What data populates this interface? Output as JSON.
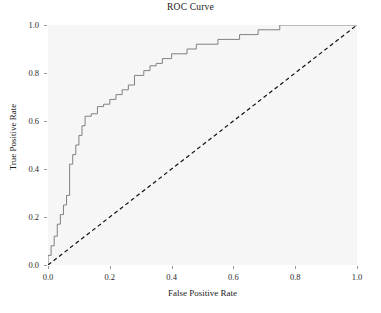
{
  "chart_data": {
    "type": "line",
    "title": "ROC Curve",
    "xlabel": "False Positive Rate",
    "ylabel": "True Positive Rate",
    "xlim": [
      0.0,
      1.0
    ],
    "ylim": [
      0.0,
      1.0
    ],
    "grid": false,
    "legend": "none",
    "panel_background": "#f6f6f6",
    "series": [
      {
        "name": "ROC curve",
        "type": "step",
        "color": "#808080",
        "linestyle": "solid",
        "linewidth": 1.0,
        "x": [
          0.0,
          0.0,
          0.01,
          0.01,
          0.02,
          0.02,
          0.03,
          0.03,
          0.04,
          0.04,
          0.05,
          0.05,
          0.06,
          0.06,
          0.07,
          0.07,
          0.08,
          0.08,
          0.09,
          0.09,
          0.1,
          0.1,
          0.11,
          0.11,
          0.12,
          0.12,
          0.14,
          0.14,
          0.16,
          0.16,
          0.18,
          0.18,
          0.2,
          0.2,
          0.22,
          0.22,
          0.24,
          0.24,
          0.26,
          0.26,
          0.28,
          0.28,
          0.31,
          0.31,
          0.33,
          0.33,
          0.35,
          0.35,
          0.37,
          0.37,
          0.4,
          0.4,
          0.43,
          0.43,
          0.45,
          0.45,
          0.48,
          0.48,
          0.52,
          0.52,
          0.55,
          0.55,
          0.58,
          0.58,
          0.62,
          0.62,
          0.65,
          0.65,
          0.68,
          0.68,
          0.72,
          0.72,
          0.75,
          0.75,
          0.78,
          0.78,
          1.0
        ],
        "y": [
          0.0,
          0.04,
          0.04,
          0.08,
          0.08,
          0.12,
          0.12,
          0.17,
          0.17,
          0.21,
          0.21,
          0.25,
          0.25,
          0.29,
          0.29,
          0.42,
          0.42,
          0.46,
          0.46,
          0.5,
          0.5,
          0.54,
          0.54,
          0.58,
          0.58,
          0.62,
          0.62,
          0.63,
          0.63,
          0.66,
          0.66,
          0.67,
          0.67,
          0.69,
          0.69,
          0.71,
          0.71,
          0.73,
          0.73,
          0.75,
          0.75,
          0.79,
          0.79,
          0.81,
          0.81,
          0.83,
          0.83,
          0.84,
          0.84,
          0.86,
          0.86,
          0.88,
          0.88,
          0.88,
          0.88,
          0.9,
          0.9,
          0.92,
          0.92,
          0.92,
          0.92,
          0.94,
          0.94,
          0.94,
          0.94,
          0.96,
          0.96,
          0.96,
          0.96,
          0.98,
          0.98,
          0.98,
          0.98,
          1.0,
          1.0,
          1.0,
          1.0
        ]
      },
      {
        "name": "Chance reference line",
        "type": "line",
        "color": "#000000",
        "linestyle": "dashed",
        "linewidth": 1.2,
        "x": [
          0.0,
          1.0
        ],
        "y": [
          0.0,
          1.0
        ]
      }
    ],
    "x_ticks": [
      {
        "value": 0.0,
        "label": "0.0"
      },
      {
        "value": 0.2,
        "label": "0.2"
      },
      {
        "value": 0.4,
        "label": "0.4"
      },
      {
        "value": 0.6,
        "label": "0.6"
      },
      {
        "value": 0.8,
        "label": "0.8"
      },
      {
        "value": 1.0,
        "label": "1.0"
      }
    ],
    "y_ticks": [
      {
        "value": 0.0,
        "label": "0.0"
      },
      {
        "value": 0.2,
        "label": "0.2"
      },
      {
        "value": 0.4,
        "label": "0.4"
      },
      {
        "value": 0.6,
        "label": "0.6"
      },
      {
        "value": 0.8,
        "label": "0.8"
      },
      {
        "value": 1.0,
        "label": "1.0"
      }
    ]
  }
}
